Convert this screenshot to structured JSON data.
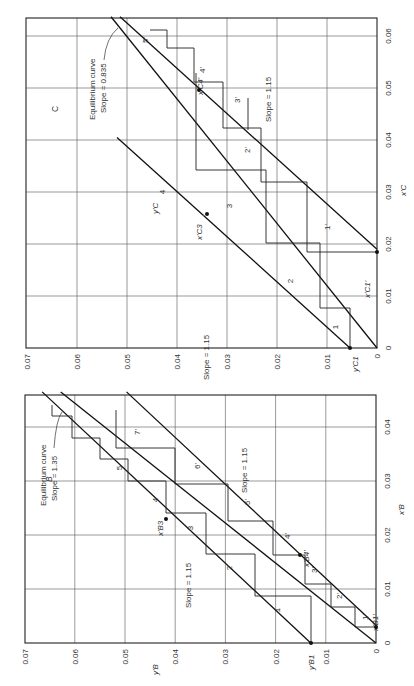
{
  "figure": {
    "orientation": "rotated-90-ccw",
    "panels": [
      {
        "id": "C",
        "panel_label": "C",
        "xlabel": "x'C",
        "ylabel": "y'C",
        "x_ticks": [
          "0",
          "0.01",
          "0.02",
          "0.03",
          "0.04",
          "0.05",
          "0.06"
        ],
        "y_ticks": [
          "0",
          "0.01",
          "0.02",
          "0.03",
          "0.04",
          "0.05",
          "0.06",
          "0.07"
        ],
        "annotations": {
          "equilibrium": "Equilibrium curve",
          "equilibrium_slope": "Slope = 0.835",
          "op_slope_upper": "Slope = 1.15",
          "op_slope_lower": "Slope = 1.15",
          "point_xc1": "x'C1'",
          "point_yc1": "y'C1",
          "point_xc3": "x'C3",
          "point_xc4": "x'C4'"
        },
        "stage_labels": [
          "1",
          "2",
          "3",
          "4",
          "1'",
          "2'",
          "3'",
          "4'",
          "5'"
        ]
      },
      {
        "id": "B",
        "panel_label": "B",
        "xlabel": "x'B",
        "ylabel": "y'B",
        "x_ticks": [
          "0",
          "0.01",
          "0.02",
          "0.03",
          "0.04"
        ],
        "y_ticks": [
          "0",
          "0.01",
          "0.02",
          "0.03",
          "0.04",
          "0.05",
          "0.06",
          "0.07"
        ],
        "annotations": {
          "equilibrium": "Equilibrium curve",
          "equilibrium_slope": "Slope = 1.35",
          "op_slope_upper": "Slope = 1.15",
          "op_slope_lower": "Slope = 1.15",
          "point_xb1": "x'B1'",
          "point_yb1": "y'B1",
          "point_xb3": "x'B3",
          "point_xb4": "x'B4'"
        },
        "stage_labels": [
          "1",
          "2",
          "3",
          "4",
          "5",
          "1'",
          "2'",
          "3'",
          "4'",
          "5'",
          "6'",
          "7'"
        ]
      }
    ]
  },
  "chart_data": [
    {
      "type": "line",
      "title": "C",
      "xlabel": "x'C",
      "ylabel": "y'C",
      "xlim": [
        0,
        0.064
      ],
      "ylim": [
        0,
        0.07
      ],
      "grid": true,
      "x_ticks": [
        0,
        0.01,
        0.02,
        0.03,
        0.04,
        0.05,
        0.06
      ],
      "y_ticks": [
        0,
        0.01,
        0.02,
        0.03,
        0.04,
        0.05,
        0.06,
        0.07
      ],
      "series": [
        {
          "name": "Equilibrium curve (Slope = 0.835)",
          "points": [
            [
              0,
              0
            ],
            [
              0.0637,
              0.0532
            ]
          ]
        },
        {
          "name": "Operating line stripping (Slope = 1.15)",
          "points": [
            [
              0.019,
              0
            ],
            [
              0.0637,
              0.0514
            ]
          ]
        },
        {
          "name": "Operating line lower (Slope = 1.15)",
          "points": [
            [
              0,
              0.0054
            ],
            [
              0.0255,
              0.0347
            ]
          ]
        },
        {
          "name": "Operating line upper (Slope = 1.15)",
          "points": [
            [
              0.0255,
              0.0347
            ],
            [
              0.0405,
              0.052
            ]
          ]
        }
      ],
      "key_points": [
        {
          "label": "y'C1",
          "x": 0,
          "y": 0.0054
        },
        {
          "label": "x'C1'",
          "x": 0.019,
          "y": 0
        },
        {
          "label": "x'C3",
          "x": 0.0255,
          "y": 0.0347
        },
        {
          "label": "x'C4'",
          "x": 0.0505,
          "y": 0.0363
        }
      ],
      "annotations": [
        "Equilibrium curve Slope = 0.835",
        "Slope = 1.15",
        "Slope = 1.15",
        "C"
      ],
      "stages": [
        "1",
        "2",
        "3",
        "4",
        "1'",
        "2'",
        "3'",
        "4'",
        "5'"
      ]
    },
    {
      "type": "line",
      "title": "B",
      "xlabel": "x'B",
      "ylabel": "y'B",
      "xlim": [
        0,
        0.0465
      ],
      "ylim": [
        0,
        0.07
      ],
      "grid": true,
      "x_ticks": [
        0,
        0.01,
        0.02,
        0.03,
        0.04
      ],
      "y_ticks": [
        0,
        0.01,
        0.02,
        0.03,
        0.04,
        0.05,
        0.06,
        0.07
      ],
      "series": [
        {
          "name": "Equilibrium curve (Slope = 1.35)",
          "points": [
            [
              0,
              0
            ],
            [
              0.0465,
              0.0628
            ]
          ]
        },
        {
          "name": "Operating line lower (Slope = 1.15)",
          "points": [
            [
              0,
              0.013
            ],
            [
              0.0465,
              0.0665
            ]
          ]
        },
        {
          "name": "Operating line upper (Slope = 1.15)",
          "points": [
            [
              0.0033,
              0
            ],
            [
              0.0465,
              0.0497
            ]
          ]
        }
      ],
      "key_points": [
        {
          "label": "y'B1",
          "x": 0,
          "y": 0.013
        },
        {
          "label": "x'B1'",
          "x": 0.0033,
          "y": 0
        },
        {
          "label": "x'B3",
          "x": 0.0245,
          "y": 0.0412
        },
        {
          "label": "x'B4'",
          "x": 0.0165,
          "y": 0.0155
        }
      ],
      "annotations": [
        "Equilibrium curve Slope = 1.35",
        "Slope = 1.15",
        "Slope = 1.15",
        "B"
      ],
      "stages": [
        "1",
        "2",
        "3",
        "4",
        "5",
        "1'",
        "2'",
        "3'",
        "4'",
        "5'",
        "6'",
        "7'"
      ]
    }
  ]
}
